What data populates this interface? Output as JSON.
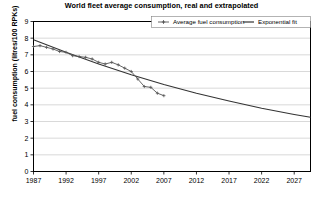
{
  "chart_data": {
    "type": "line",
    "title": "World fleet average consumption, real and extrapolated",
    "xlabel": "",
    "ylabel": "fuel consumption (litres/100 RPKs)",
    "xlim": [
      1987,
      2029.5
    ],
    "ylim": [
      0,
      9
    ],
    "grid": true,
    "legend_position": "top-inside",
    "xticks": [
      1987,
      1992,
      1997,
      2002,
      2007,
      2012,
      2017,
      2022,
      2027
    ],
    "yticks": [
      0,
      1,
      2,
      3,
      4,
      5,
      6,
      7,
      8,
      9
    ],
    "series": [
      {
        "name": "Average fuel consumption",
        "style": "line-with-cross-markers",
        "color": "#555555",
        "x": [
          1987,
          1988,
          1989,
          1990,
          1991,
          1992,
          1993,
          1994,
          1995,
          1996,
          1997,
          1998,
          1999,
          2000,
          2001,
          2002,
          2003,
          2004,
          2005,
          2006,
          2007
        ],
        "values": [
          7.5,
          7.55,
          7.45,
          7.35,
          7.2,
          7.15,
          6.95,
          6.9,
          6.85,
          6.75,
          6.55,
          6.45,
          6.55,
          6.4,
          6.2,
          6.0,
          5.55,
          5.1,
          5.05,
          4.7,
          4.55
        ]
      },
      {
        "name": "Exponential fit",
        "style": "line",
        "color": "#333333",
        "x": [
          1987,
          1992,
          1997,
          2002,
          2007,
          2012,
          2017,
          2022,
          2027,
          2029.5
        ],
        "values": [
          7.9,
          7.15,
          6.45,
          5.8,
          5.22,
          4.7,
          4.23,
          3.8,
          3.42,
          3.25
        ]
      }
    ]
  },
  "legend": {
    "entries": [
      {
        "label": "Average fuel consumption",
        "marker": "line-cross-marker"
      },
      {
        "label": "Exponential fit",
        "marker": "line-plain"
      }
    ]
  },
  "colors": {
    "axis": "#000000",
    "grid": "#bfbfbf",
    "series_observed": "#555555",
    "series_fit": "#333333",
    "background": "#ffffff"
  }
}
